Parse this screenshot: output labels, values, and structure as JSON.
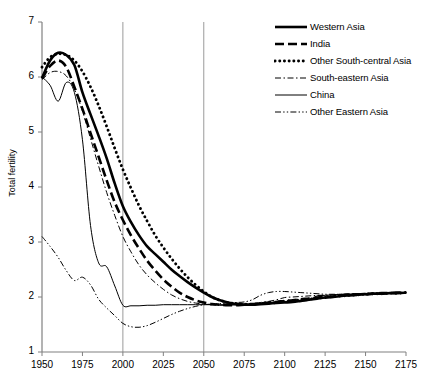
{
  "chart_data": {
    "type": "line",
    "title": "",
    "xlabel": "",
    "ylabel": "Total fertility",
    "xlim": [
      1950,
      2175
    ],
    "ylim": [
      1,
      7
    ],
    "xticks": [
      1950,
      1975,
      2000,
      2025,
      2050,
      2075,
      2100,
      2125,
      2150,
      2175
    ],
    "yticks": [
      1,
      2,
      3,
      4,
      5,
      6,
      7
    ],
    "grid": "vertical-only",
    "gridlines_x": [
      2000,
      2050
    ],
    "legend_position": "top-right",
    "x": [
      1950,
      1955,
      1960,
      1965,
      1970,
      1975,
      1980,
      1985,
      1990,
      1995,
      2000,
      2005,
      2010,
      2015,
      2020,
      2025,
      2030,
      2035,
      2040,
      2045,
      2050,
      2055,
      2060,
      2065,
      2070,
      2075,
      2080,
      2085,
      2090,
      2095,
      2100,
      2105,
      2110,
      2115,
      2120,
      2125,
      2130,
      2135,
      2140,
      2145,
      2150,
      2155,
      2160,
      2165,
      2170,
      2175
    ],
    "series": [
      {
        "name": "Western Asia",
        "style": "solid-thick",
        "values": [
          5.98,
          6.3,
          6.44,
          6.4,
          6.22,
          5.72,
          5.32,
          4.93,
          4.52,
          4.06,
          3.65,
          3.36,
          3.12,
          2.92,
          2.78,
          2.64,
          2.5,
          2.38,
          2.27,
          2.17,
          2.08,
          2.0,
          1.94,
          1.9,
          1.87,
          1.86,
          1.86,
          1.87,
          1.88,
          1.89,
          1.9,
          1.91,
          1.93,
          1.95,
          1.97,
          1.99,
          2.0,
          2.02,
          2.03,
          2.04,
          2.05,
          2.06,
          2.06,
          2.07,
          2.07,
          2.08
        ]
      },
      {
        "name": "India",
        "style": "dashed-thick",
        "values": [
          5.97,
          6.2,
          6.3,
          6.18,
          5.82,
          5.42,
          4.98,
          4.55,
          4.12,
          3.72,
          3.4,
          3.12,
          2.88,
          2.66,
          2.48,
          2.32,
          2.19,
          2.08,
          2.0,
          1.94,
          1.9,
          1.87,
          1.86,
          1.85,
          1.85,
          1.86,
          1.87,
          1.88,
          1.9,
          1.91,
          1.93,
          1.94,
          1.96,
          1.97,
          1.99,
          2.0,
          2.01,
          2.03,
          2.04,
          2.05,
          2.05,
          2.06,
          2.07,
          2.07,
          2.08,
          2.08
        ]
      },
      {
        "name": "Other South-central Asia",
        "style": "dotted-thick",
        "values": [
          6.18,
          6.36,
          6.42,
          6.4,
          6.3,
          6.1,
          5.82,
          5.48,
          5.1,
          4.7,
          4.32,
          3.98,
          3.66,
          3.38,
          3.12,
          2.9,
          2.7,
          2.52,
          2.36,
          2.22,
          2.1,
          2.0,
          1.94,
          1.9,
          1.88,
          1.87,
          1.87,
          1.88,
          1.89,
          1.9,
          1.92,
          1.93,
          1.95,
          1.96,
          1.98,
          1.99,
          2.01,
          2.02,
          2.03,
          2.04,
          2.05,
          2.06,
          2.06,
          2.07,
          2.07,
          2.08
        ]
      },
      {
        "name": "South-eastern Asia",
        "style": "dashdot-thin",
        "values": [
          5.95,
          6.08,
          6.1,
          6.02,
          5.78,
          5.38,
          4.88,
          4.38,
          3.9,
          3.48,
          3.1,
          2.82,
          2.58,
          2.4,
          2.26,
          2.14,
          2.04,
          1.97,
          1.92,
          1.89,
          1.87,
          1.86,
          1.85,
          1.85,
          1.86,
          1.87,
          1.88,
          1.9,
          1.92,
          1.95,
          1.99,
          2.0,
          2.01,
          2.02,
          2.03,
          2.03,
          2.04,
          2.05,
          2.05,
          2.06,
          2.06,
          2.07,
          2.07,
          2.07,
          2.08,
          2.08
        ]
      },
      {
        "name": "China",
        "style": "solid-thin",
        "values": [
          6.0,
          5.85,
          5.56,
          5.9,
          5.72,
          4.86,
          3.3,
          2.62,
          2.55,
          2.2,
          1.85,
          1.84,
          1.84,
          1.85,
          1.85,
          1.86,
          1.86,
          1.86,
          1.86,
          1.86,
          1.86,
          1.86,
          1.86,
          1.86,
          1.86,
          1.86,
          1.87,
          1.88,
          1.9,
          1.91,
          1.92,
          1.92,
          1.93,
          1.94,
          2.02,
          2.03,
          2.04,
          2.05,
          2.05,
          2.06,
          2.06,
          2.07,
          2.07,
          2.07,
          2.08,
          2.08
        ]
      },
      {
        "name": "Other Eastern Asia",
        "style": "dashdotdot-thin",
        "values": [
          3.1,
          2.92,
          2.72,
          2.48,
          2.3,
          2.36,
          2.22,
          1.96,
          1.8,
          1.66,
          1.52,
          1.46,
          1.45,
          1.48,
          1.54,
          1.61,
          1.68,
          1.74,
          1.79,
          1.83,
          1.86,
          1.87,
          1.88,
          1.89,
          1.9,
          1.91,
          1.95,
          2.03,
          2.08,
          2.1,
          2.1,
          2.09,
          2.08,
          2.07,
          2.06,
          2.05,
          2.05,
          2.05,
          2.06,
          2.06,
          2.07,
          2.07,
          2.07,
          2.08,
          2.08,
          2.08
        ]
      }
    ]
  },
  "legend": {
    "items": [
      {
        "label": "Western Asia",
        "key": "line-key-solid-thick"
      },
      {
        "label": "India",
        "key": "line-key-dashed-thick"
      },
      {
        "label": "Other South-central Asia",
        "key": "line-key-dotted-thick"
      },
      {
        "label": "South-eastern Asia",
        "key": "line-key-dashdot-thin"
      },
      {
        "label": "China",
        "key": "line-key-solid-thin"
      },
      {
        "label": "Other Eastern Asia",
        "key": "line-key-dashdotdot-thin"
      }
    ]
  },
  "axes": {
    "y_title": "Total fertility",
    "y_tick_labels": [
      "7",
      "6",
      "5",
      "4",
      "3",
      "2",
      "1"
    ],
    "x_tick_labels": [
      "1950",
      "1975",
      "2000",
      "2025",
      "2050",
      "2075",
      "2100",
      "2125",
      "2150",
      "2175"
    ]
  },
  "colors": {
    "line": "#000000",
    "axis": "#808080",
    "gridline": "#9a9a9a",
    "background": "#ffffff"
  }
}
